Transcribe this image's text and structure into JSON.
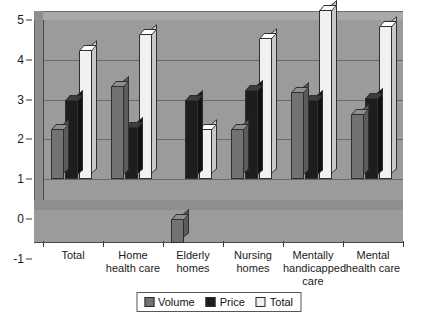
{
  "chart_data": {
    "type": "bar",
    "title": "",
    "xlabel": "",
    "ylabel": "",
    "ylim": [
      -1,
      5
    ],
    "yticks": [
      "5",
      "4",
      "3",
      "2",
      "1",
      "0",
      "-1"
    ],
    "grid": true,
    "legend_position": "bottom",
    "style": "3d-clustered-column",
    "categories": [
      "Total",
      "Home health care",
      "Elderly homes",
      "Nursing homes",
      "Mentally handicapped care",
      "Mental health care"
    ],
    "series": [
      {
        "name": "Volume",
        "color": "#727272",
        "values": [
          1.25,
          2.35,
          -0.6,
          1.25,
          2.2,
          1.65
        ]
      },
      {
        "name": "Price",
        "color": "#1d1d1d",
        "values": [
          2.0,
          1.3,
          2.0,
          2.25,
          2.0,
          2.05
        ]
      },
      {
        "name": "Total",
        "color": "#f1f1f1",
        "values": [
          3.25,
          3.65,
          1.25,
          3.55,
          4.25,
          3.85
        ]
      }
    ]
  },
  "legend": {
    "items": [
      {
        "label": "Volume"
      },
      {
        "label": "Price"
      },
      {
        "label": "Total"
      }
    ]
  },
  "colors": {
    "plot_background": "#9b9b9b",
    "floor": "#8e8e8e",
    "gridline": "#6a6a6a",
    "axis": "#3a3a3a",
    "page_background": "#ffffff"
  }
}
